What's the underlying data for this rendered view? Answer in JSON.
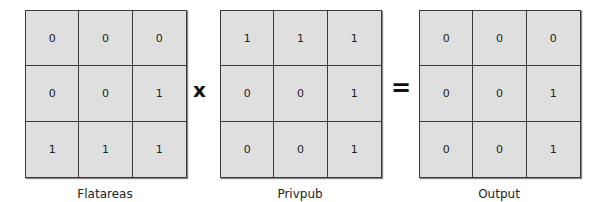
{
  "operators": {
    "times": "x",
    "equals": "="
  },
  "matrices": [
    {
      "name": "Flatareas",
      "cells": [
        [
          "0",
          "0",
          "0"
        ],
        [
          "0",
          "0",
          "1"
        ],
        [
          "1",
          "1",
          "1"
        ]
      ]
    },
    {
      "name": "Privpub",
      "cells": [
        [
          "1",
          "1",
          "1"
        ],
        [
          "0",
          "0",
          "1"
        ],
        [
          "0",
          "0",
          "1"
        ]
      ]
    },
    {
      "name": "Output",
      "cells": [
        [
          "0",
          "0",
          "0"
        ],
        [
          "0",
          "0",
          "1"
        ],
        [
          "0",
          "0",
          "1"
        ]
      ]
    }
  ],
  "colors": {
    "cell_fill": "#dfdfdf",
    "grid_line": "#3a3a3a",
    "text": "#222222"
  }
}
